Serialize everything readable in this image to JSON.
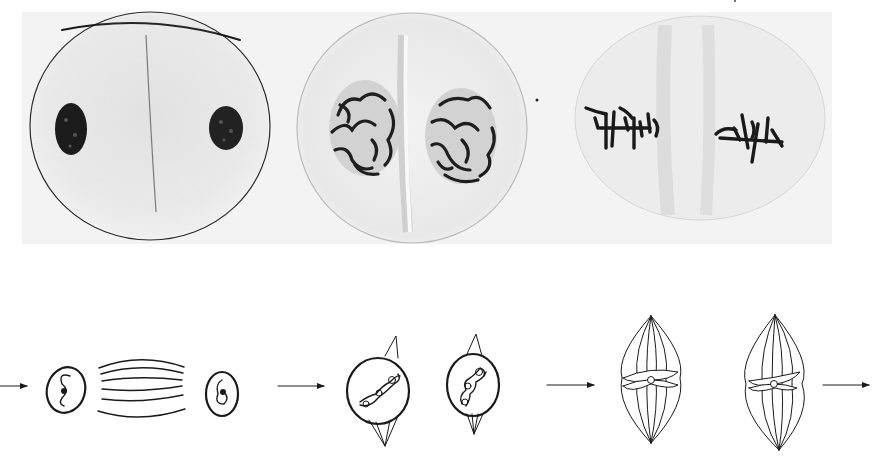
{
  "figure": {
    "colors": {
      "background": "#ffffff",
      "photo_background": "#f1f1f1",
      "cytoplasm": "#e9e9e9",
      "chromatin": "#1e1e1e",
      "line": "#1a1a1a"
    },
    "micrographs": [
      {
        "name": "late-telophase-cell",
        "stage": "telophase / interphase reforming",
        "nuclei": 2
      },
      {
        "name": "prophase-pair-cell",
        "stage": "prophase (two daughter cells)",
        "nuclei": 2
      },
      {
        "name": "metaphase-pair-cell",
        "stage": "metaphase (two daughter cells)",
        "nuclei": 2
      }
    ],
    "schematics": [
      {
        "name": "telophase-schematic",
        "parts": [
          "nucleus-left",
          "spindle-fibers",
          "nucleus-right"
        ]
      },
      {
        "name": "prophase-schematic",
        "parts": [
          "prophase-cell-left",
          "prophase-cell-right"
        ]
      },
      {
        "name": "metaphase-schematic",
        "parts": [
          "spindle-left",
          "spindle-right"
        ]
      }
    ],
    "arrows": [
      {
        "name": "arrow-1",
        "direction": "right"
      },
      {
        "name": "arrow-2",
        "direction": "right"
      },
      {
        "name": "arrow-3",
        "direction": "right"
      },
      {
        "name": "arrow-4",
        "direction": "right"
      }
    ]
  }
}
